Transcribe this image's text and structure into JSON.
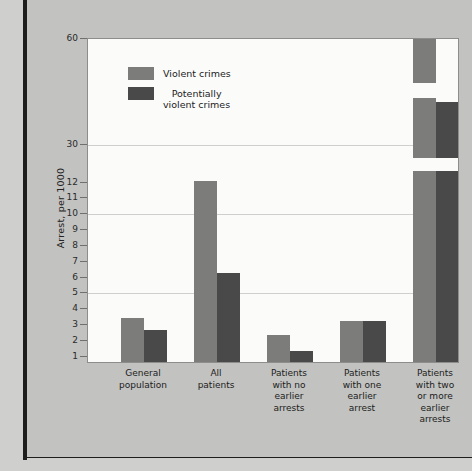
{
  "figure": {
    "y_axis_title": "Arrest, per 1000",
    "y_tick_labels": [
      "60",
      "30",
      "12",
      "11",
      "10",
      "9",
      "8",
      "7",
      "6",
      "5",
      "4",
      "3",
      "2",
      "1"
    ],
    "legend": [
      {
        "label": "Violent crimes",
        "color": "#7c7c7a",
        "swatch": "violent-crimes-swatch"
      },
      {
        "label": "Potentially\nviolent crimes",
        "color": "#494949",
        "swatch": "potentially-violent-crimes-swatch"
      }
    ],
    "categories": [
      "General\npopulation",
      "All\npatients",
      "Patients\nwith no\nearlier\narrests",
      "Patients\nwith one\nearlier\narrest",
      "Patients\nwith two\nor more\nearlier\narrests"
    ]
  },
  "chart_data": {
    "type": "bar",
    "title": "",
    "xlabel": "",
    "ylabel": "Arrest, per 1000",
    "grid": true,
    "legend_position": "top-left",
    "y_axis_note": "Broken / compressed axis: linear 1-12, then compressed steps to 30 and 60",
    "yticks": [
      1,
      2,
      3,
      4,
      5,
      6,
      7,
      8,
      9,
      10,
      11,
      12,
      30,
      60
    ],
    "ylim": [
      0,
      60
    ],
    "categories": [
      "General population",
      "All patients",
      "Patients with no earlier arrests",
      "Patients with one earlier arrest",
      "Patients with two or more earlier arrests"
    ],
    "series": [
      {
        "name": "Violent crimes",
        "color": "#7c7c7a",
        "values": [
          3.6,
          12.0,
          2.2,
          3.35,
          60
        ]
      },
      {
        "name": "Potentially violent crimes",
        "color": "#494949",
        "values": [
          2.8,
          6.2,
          0.85,
          3.35,
          38
        ]
      }
    ]
  },
  "render": {
    "tick_positions": [
      {
        "label": "60",
        "y": 0,
        "grid": false
      },
      {
        "label": "30",
        "y": 106,
        "grid": true
      },
      {
        "label": "12",
        "y": 144,
        "grid": false
      },
      {
        "label": "11",
        "y": 159,
        "grid": false
      },
      {
        "label": "10",
        "y": 175,
        "grid": true
      },
      {
        "label": "9",
        "y": 191,
        "grid": false
      },
      {
        "label": "8",
        "y": 207,
        "grid": false
      },
      {
        "label": "7",
        "y": 223,
        "grid": false
      },
      {
        "label": "6",
        "y": 239,
        "grid": false
      },
      {
        "label": "5",
        "y": 254,
        "grid": true
      },
      {
        "label": "4",
        "y": 270,
        "grid": false
      },
      {
        "label": "3",
        "y": 286,
        "grid": false
      },
      {
        "label": "2",
        "y": 302,
        "grid": false
      },
      {
        "label": "1",
        "y": 318,
        "grid": false
      }
    ],
    "bars": [
      {
        "name": "bar-general-population-violent",
        "series": "violent",
        "left": 33,
        "width": 23,
        "height": 44
      },
      {
        "name": "bar-general-population-pviolent",
        "series": "pviolent",
        "left": 56,
        "width": 23,
        "height": 32
      },
      {
        "name": "bar-all-patients-violent",
        "series": "violent",
        "left": 106,
        "width": 23,
        "height": 181
      },
      {
        "name": "bar-all-patients-pviolent",
        "series": "pviolent",
        "left": 129,
        "width": 23,
        "height": 89
      },
      {
        "name": "bar-no-earlier-arrests-violent",
        "series": "violent",
        "left": 179,
        "width": 23,
        "height": 27
      },
      {
        "name": "bar-no-earlier-arrests-pviolent",
        "series": "pviolent",
        "left": 202,
        "width": 23,
        "height": 11
      },
      {
        "name": "bar-one-earlier-arrest-violent",
        "series": "violent",
        "left": 252,
        "width": 23,
        "height": 41
      },
      {
        "name": "bar-one-earlier-arrest-pviolent",
        "series": "pviolent",
        "left": 275,
        "width": 23,
        "height": 41
      },
      {
        "name": "bar-two-or-more-arrests-violent",
        "series": "violent",
        "left": 325,
        "width": 23,
        "height": 325
      },
      {
        "name": "bar-two-or-more-arrests-pviolent",
        "series": "pviolent",
        "left": 348,
        "width": 23,
        "height": 260
      }
    ],
    "bar_breaks": [
      {
        "name": "axis-break-gap-violent-upper",
        "left": 325,
        "top": 44,
        "width": 23,
        "height": 15
      },
      {
        "name": "axis-break-gap-violent-lower",
        "left": 325,
        "top": 119,
        "width": 23,
        "height": 13
      },
      {
        "name": "axis-break-gap-pviolent-lower",
        "left": 348,
        "top": 119,
        "width": 23,
        "height": 13
      }
    ],
    "cat_positions": [
      {
        "left": 10,
        "width": 92
      },
      {
        "left": 83,
        "width": 92
      },
      {
        "left": 156,
        "width": 92
      },
      {
        "left": 229,
        "width": 92
      },
      {
        "left": 302,
        "width": 92
      }
    ]
  }
}
